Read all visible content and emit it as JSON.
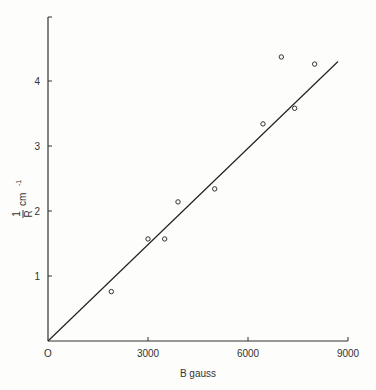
{
  "chart_data": {
    "type": "scatter",
    "title": "",
    "xlabel": "B gauss",
    "ylabel": "1/R cm⁻¹",
    "ylabel_num": "1",
    "ylabel_den": "R",
    "ylabel_unit": "cm",
    "ylabel_exp": "-1",
    "xlim": [
      0,
      9000
    ],
    "ylim": [
      0,
      4.9
    ],
    "x_ticks": [
      0,
      3000,
      6000,
      9000
    ],
    "x_tick_labels": [
      "O",
      "3000",
      "6000",
      "9000"
    ],
    "y_ticks": [
      1,
      2,
      3,
      4
    ],
    "y_tick_labels": [
      "1",
      "2",
      "3",
      "4"
    ],
    "grid": false,
    "legend": null,
    "series": [
      {
        "name": "measured",
        "marker": "open-circle",
        "x": [
          1900,
          3000,
          3500,
          3900,
          5000,
          6450,
          7000,
          7400,
          8000
        ],
        "y": [
          0.76,
          1.57,
          1.57,
          2.14,
          2.34,
          3.34,
          4.37,
          3.58,
          4.26
        ]
      },
      {
        "name": "fit",
        "style": "line",
        "x": [
          0,
          8700
        ],
        "y": [
          0,
          4.3
        ]
      }
    ]
  }
}
